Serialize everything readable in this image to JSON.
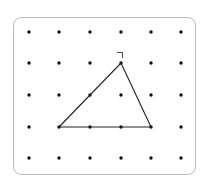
{
  "board": {
    "border_color": "#b5b5b5",
    "rows": 5,
    "cols": 6,
    "x_positions": [
      29,
      59,
      90,
      121,
      151,
      181
    ],
    "y_positions": [
      32,
      63,
      95,
      127,
      158
    ]
  },
  "shape": {
    "type": "triangle",
    "vertices_grid": [
      [
        1,
        3
      ],
      [
        3,
        1
      ],
      [
        4,
        3
      ]
    ],
    "stroke_color": "#222222"
  },
  "marker": {
    "type": "right-angle-mark",
    "near_vertex_grid": [
      3,
      1
    ]
  }
}
